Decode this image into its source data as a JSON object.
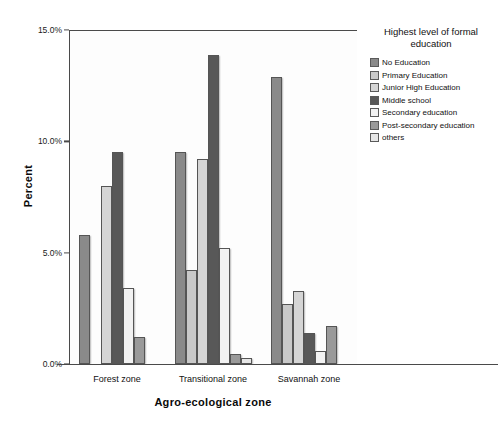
{
  "chart_data": {
    "type": "bar",
    "title": "",
    "xlabel": "Agro-ecological zone",
    "ylabel": "Percent",
    "categories": [
      "Forest zone",
      "Transitional zone",
      "Savannah zone"
    ],
    "ylim": [
      0,
      15
    ],
    "ytick_labels": [
      "0.0%",
      "5.0%",
      "10.0%",
      "15.0%"
    ],
    "ytick_values": [
      0,
      5,
      10,
      15
    ],
    "grid": false,
    "legend_position": "right",
    "legend_title": "Highest level of formal education",
    "series": [
      {
        "name": "No Education",
        "color": "#8a8a8a",
        "values": [
          5.8,
          9.5,
          12.9
        ]
      },
      {
        "name": "Primary Education",
        "color": "#c9c9c9",
        "values": [
          0.0,
          4.2,
          2.7
        ]
      },
      {
        "name": "Junior High Education",
        "color": "#d5d5d5",
        "values": [
          8.0,
          9.2,
          3.3
        ]
      },
      {
        "name": "Middle school",
        "color": "#585858",
        "values": [
          9.5,
          13.9,
          1.4
        ]
      },
      {
        "name": "Secondary education",
        "color": "#f2f2f2",
        "values": [
          3.4,
          5.2,
          0.6
        ]
      },
      {
        "name": "Post-secondary education",
        "color": "#9a9a9a",
        "values": [
          1.2,
          0.45,
          1.7
        ]
      },
      {
        "name": "others",
        "color": "#e6e6e6",
        "values": [
          0.0,
          0.25,
          0.0
        ]
      }
    ]
  }
}
